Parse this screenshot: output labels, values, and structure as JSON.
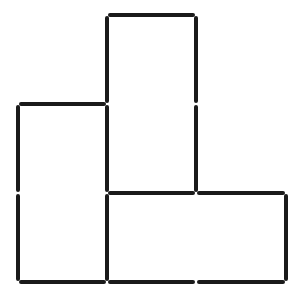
{
  "diagram": {
    "type": "matchstick-puzzle",
    "stick_color": "#1a1a1a",
    "background_color": "#ffffff",
    "stick_width": 4,
    "gap": 3,
    "grid": {
      "columns_x": [
        18,
        107,
        196,
        286
      ],
      "rows_y": [
        15,
        104,
        193,
        282
      ]
    },
    "stick_count": 15,
    "sticks": [
      {
        "id": "h-top",
        "orientation": "horizontal",
        "from": [
          107,
          15
        ],
        "to": [
          196,
          15
        ]
      },
      {
        "id": "h-left-top",
        "orientation": "horizontal",
        "from": [
          18,
          104
        ],
        "to": [
          107,
          104
        ]
      },
      {
        "id": "h-mid-1",
        "orientation": "horizontal",
        "from": [
          107,
          193
        ],
        "to": [
          196,
          193
        ]
      },
      {
        "id": "h-mid-2",
        "orientation": "horizontal",
        "from": [
          196,
          193
        ],
        "to": [
          286,
          193
        ]
      },
      {
        "id": "h-bottom-1",
        "orientation": "horizontal",
        "from": [
          18,
          282
        ],
        "to": [
          107,
          282
        ]
      },
      {
        "id": "h-bottom-2",
        "orientation": "horizontal",
        "from": [
          107,
          282
        ],
        "to": [
          196,
          282
        ]
      },
      {
        "id": "h-bottom-3",
        "orientation": "horizontal",
        "from": [
          196,
          282
        ],
        "to": [
          286,
          282
        ]
      },
      {
        "id": "v-left-1",
        "orientation": "vertical",
        "from": [
          18,
          104
        ],
        "to": [
          18,
          193
        ]
      },
      {
        "id": "v-left-2",
        "orientation": "vertical",
        "from": [
          18,
          193
        ],
        "to": [
          18,
          282
        ]
      },
      {
        "id": "v-col2-1",
        "orientation": "vertical",
        "from": [
          107,
          15
        ],
        "to": [
          107,
          104
        ]
      },
      {
        "id": "v-col2-2",
        "orientation": "vertical",
        "from": [
          107,
          104
        ],
        "to": [
          107,
          193
        ]
      },
      {
        "id": "v-col2-3",
        "orientation": "vertical",
        "from": [
          107,
          193
        ],
        "to": [
          107,
          282
        ]
      },
      {
        "id": "v-col3-1",
        "orientation": "vertical",
        "from": [
          196,
          15
        ],
        "to": [
          196,
          104
        ]
      },
      {
        "id": "v-col3-2",
        "orientation": "vertical",
        "from": [
          196,
          104
        ],
        "to": [
          196,
          193
        ]
      },
      {
        "id": "v-right-1",
        "orientation": "vertical",
        "from": [
          286,
          193
        ],
        "to": [
          286,
          282
        ]
      }
    ]
  }
}
